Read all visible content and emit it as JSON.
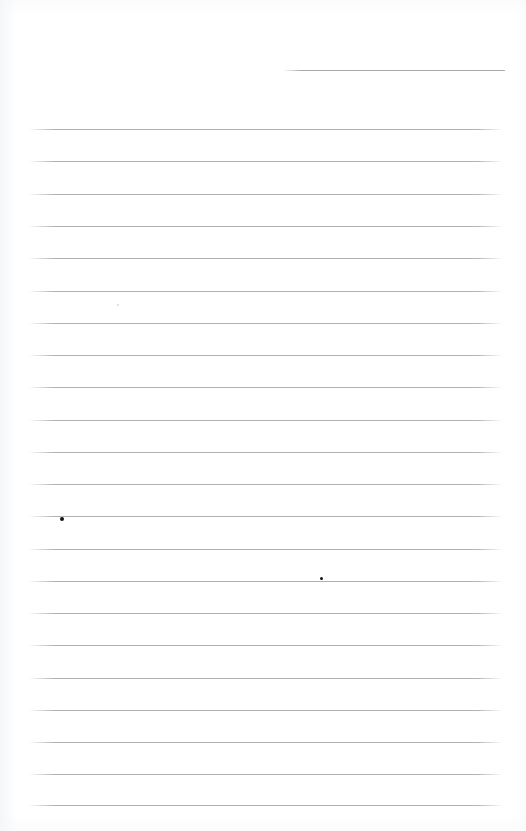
{
  "document": {
    "kind": "scanned-ruled-notepad-page",
    "title": "Blank ruled notepad page",
    "page_width": 526,
    "page_height": 831,
    "paper_color": "#ffffff",
    "rule_color": "#a9acb1",
    "ink_color": "#141414",
    "text_content": "",
    "has_handwriting": false
  },
  "header_rule": {
    "name": "date-line",
    "x": 283,
    "y": 70,
    "width": 222,
    "color": "#a4a7ac"
  },
  "rules": {
    "count": 22,
    "left_x": 28,
    "right_x": 503,
    "width": 475,
    "first_y": 129,
    "spacing": 32.25,
    "y_positions": [
      129,
      161,
      194,
      226,
      258,
      291,
      323,
      355,
      387,
      420,
      452,
      484,
      516,
      549,
      581,
      613,
      645,
      678,
      710,
      742,
      774,
      805
    ]
  },
  "marks": [
    {
      "name": "ink-dot-left",
      "x": 62,
      "y": 519,
      "size": 4,
      "color": "#141414"
    },
    {
      "name": "ink-dot-middle",
      "x": 321,
      "y": 578,
      "size": 3,
      "color": "#141414"
    },
    {
      "name": "paper-speck",
      "x": 118,
      "y": 305,
      "size": 2,
      "color": "#cfd2d6"
    }
  ]
}
